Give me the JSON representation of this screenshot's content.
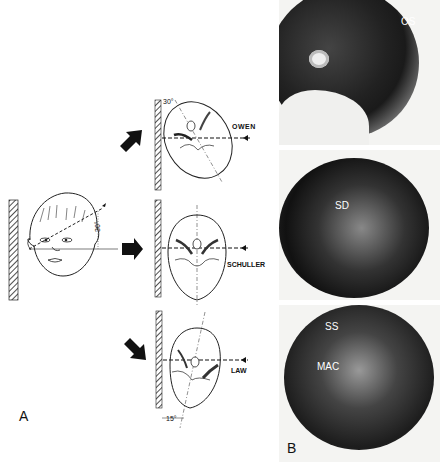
{
  "figure": {
    "panel_a": {
      "letter": "A",
      "face_angle": "30°",
      "views": [
        {
          "name": "OWEN",
          "angle": "30°"
        },
        {
          "name": "SCHULLER",
          "angle": ""
        },
        {
          "name": "LAW",
          "angle": "15°"
        }
      ]
    },
    "panel_b": {
      "letter": "B",
      "radiographs": [
        {
          "labels": [
            "OS"
          ]
        },
        {
          "labels": [
            "SD"
          ]
        },
        {
          "labels": [
            "SS",
            "MAC"
          ]
        }
      ]
    }
  }
}
